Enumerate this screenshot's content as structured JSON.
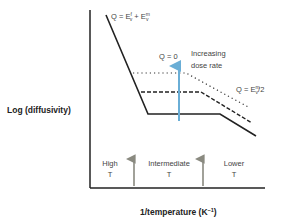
{
  "diagram": {
    "ylabel": "Log (diffusivity)",
    "xlabel_main": "1/temperature (K",
    "xlabel_sup": "−1",
    "xlabel_close": ")",
    "top_label": {
      "q": "Q = E",
      "sup1": "f",
      "sub1": "v",
      "plus": " + E",
      "sup2": "m",
      "sub2": "v"
    },
    "q_zero": "Q = 0",
    "dose_line1": "Increasing",
    "dose_line2": "dose rate",
    "half_label": {
      "q": "Q = E",
      "sup": "m",
      "sub": "v",
      "tail": "/2"
    },
    "regions": [
      {
        "line1": "High",
        "line2": "T"
      },
      {
        "line1": "Intermediate",
        "line2": "T"
      },
      {
        "line1": "Lower",
        "line2": "T"
      }
    ],
    "colors": {
      "axis": "#222222",
      "curve": "#222222",
      "dose_arrow": "#6aaed6",
      "region_arrow": "#8a8a80"
    }
  }
}
